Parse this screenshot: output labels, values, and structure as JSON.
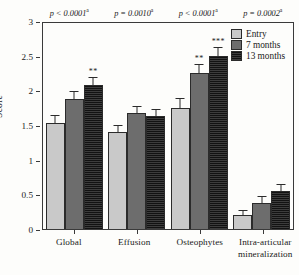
{
  "chart_data": {
    "type": "bar",
    "title": "",
    "xlabel": "",
    "ylabel": "Score",
    "ylim": [
      0,
      3
    ],
    "yticks": [
      "0",
      "0.5",
      "1",
      "1.5",
      "2",
      "2.5",
      "3"
    ],
    "grid": false,
    "legend_position": "top-right",
    "categories": [
      "Global",
      "Effusion",
      "Osteophytes",
      "Intra-articular\nmineralization"
    ],
    "series": [
      {
        "name": "Entry",
        "color": "#c9c9c9",
        "values": [
          1.53,
          1.4,
          1.75,
          0.2
        ],
        "errors": [
          0.1,
          0.09,
          0.12,
          0.06
        ],
        "significance": [
          "",
          "",
          "",
          ""
        ]
      },
      {
        "name": "7 months",
        "color": "#6d6d6d",
        "values": [
          1.87,
          1.67,
          2.25,
          0.38
        ],
        "errors": [
          0.1,
          0.09,
          0.11,
          0.08
        ],
        "significance": [
          "",
          "",
          "**",
          ""
        ]
      },
      {
        "name": "13 months",
        "color": "#262626",
        "values": [
          2.07,
          1.63,
          2.5,
          0.55
        ],
        "errors": [
          0.11,
          0.09,
          0.11,
          0.09
        ],
        "significance": [
          "**",
          "",
          "***",
          ""
        ]
      }
    ],
    "annotations": {
      "p_values": [
        "p < 0.0001",
        "p = 0.0010",
        "p < 0.0001",
        "p = 0.0002"
      ],
      "p_value_superscript": "a"
    }
  },
  "legend": {
    "items": [
      {
        "label": "Entry"
      },
      {
        "label": "7 months"
      },
      {
        "label": "13 months"
      }
    ]
  },
  "axes": {
    "y_title": "Score",
    "y_ticks": [
      "3",
      "2.5",
      "2",
      "1.5",
      "1",
      "0.5",
      "0"
    ],
    "x_ticks": [
      "Global",
      "Effusion",
      "Osteophytes",
      "Intra-articular\nmineralization"
    ]
  }
}
